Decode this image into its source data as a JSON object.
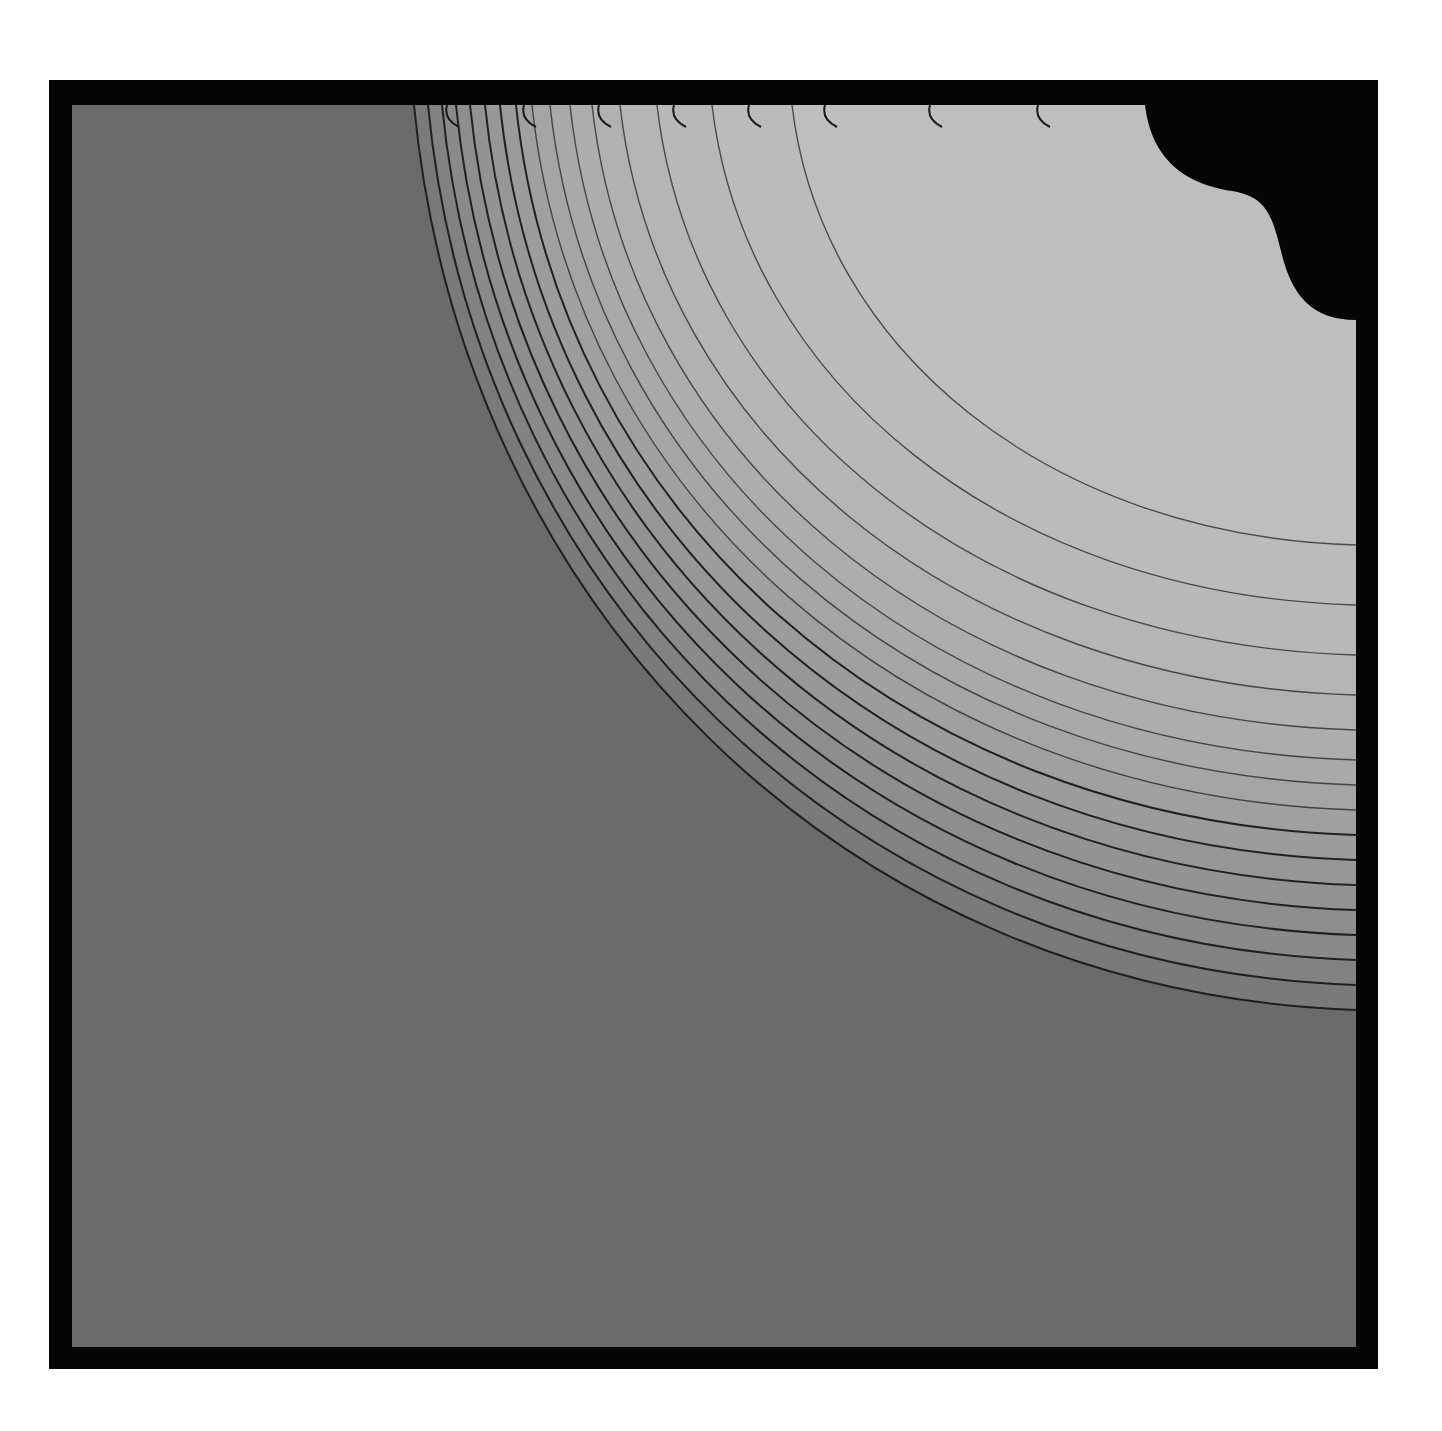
{
  "artwork": {
    "frame_color": "#050505",
    "background_color": "#6b6b6b",
    "line_color": "#1a1a1a",
    "corner_cutout_color": "#050505",
    "contour_count": 16,
    "band_colors": [
      "#7a7a7a",
      "#828282",
      "#8a8a8a",
      "#8e8e8e",
      "#939393",
      "#979797",
      "#9c9c9c",
      "#a0a0a0",
      "#a5a5a5",
      "#a9a9a9",
      "#adadad",
      "#b1b1b1",
      "#b5b5b5",
      "#b8b8b8",
      "#bbbbbb",
      "#bebebe"
    ],
    "top_start_x": [
      342,
      356,
      370,
      384,
      398,
      413,
      428,
      444,
      460,
      478,
      498,
      520,
      548,
      585,
      640,
      720
    ],
    "right_end_y": [
      905,
      880,
      855,
      830,
      805,
      780,
      755,
      730,
      705,
      680,
      655,
      625,
      590,
      550,
      500,
      440
    ],
    "short_arcs_top_x": [
      375,
      452,
      527,
      602,
      677,
      753,
      858,
      966
    ]
  }
}
